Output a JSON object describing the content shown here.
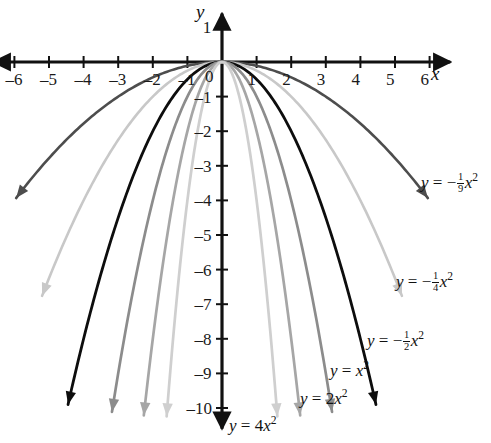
{
  "figure": {
    "axis_x_name": "x",
    "axis_y_name": "y"
  },
  "chart_data": {
    "type": "line",
    "title": "",
    "xlabel": "x",
    "ylabel": "y",
    "xlim": [
      -6.6,
      6.6
    ],
    "ylim": [
      -10.6,
      1.4
    ],
    "grid": false,
    "legend": "inline-labels",
    "x_ticks": [
      -6,
      -5,
      -4,
      -3,
      -2,
      -1,
      1,
      2,
      3,
      4,
      5,
      6
    ],
    "x_tick_labels": [
      "-6",
      "-5",
      "-4",
      "-3",
      "-2",
      "-1",
      "1",
      "2",
      "3",
      "4",
      "5",
      "6"
    ],
    "y_ticks": [
      1,
      -1,
      -2,
      -3,
      -4,
      -5,
      -6,
      -7,
      -8,
      -9,
      -10
    ],
    "y_tick_labels": [
      "1",
      "-1",
      "-2",
      "-3",
      "-4",
      "-5",
      "-6",
      "-7",
      "-8",
      "-9",
      "-10"
    ],
    "origin_label": "0",
    "series": [
      {
        "name": "y = -1/9 x^2",
        "coefficient": -0.1111,
        "color": "#4d4d4d",
        "width": 2.6,
        "x_domain": [
          -5.95,
          5.95
        ],
        "label_html": "<i>y</i> = &minus;<span class=\"frac\"><span class=\"num\">1</span><span class=\"den\">9</span></span><i>x</i><span class=\"sup\">2</span>",
        "label_pos": [
          421,
          172
        ]
      },
      {
        "name": "y = -1/4 x^2",
        "coefficient": -0.25,
        "color": "#c8c8c8",
        "width": 2.6,
        "x_domain": [
          -5.2,
          5.2
        ],
        "label_html": "<i>y</i> = &minus;<span class=\"frac\"><span class=\"num\">1</span><span class=\"den\">4</span></span><i>x</i><span class=\"sup\">2</span>",
        "label_pos": [
          396,
          271
        ]
      },
      {
        "name": "y = -1/2 x^2",
        "coefficient": -0.5,
        "color": "#0d0d0d",
        "width": 2.8,
        "x_domain": [
          -4.45,
          4.45
        ],
        "label_html": "<i>y</i> = &minus;<span class=\"frac\"><span class=\"num\">1</span><span class=\"den\">2</span></span><i>x</i><span class=\"sup\">2</span>",
        "label_pos": [
          367,
          330
        ]
      },
      {
        "name": "y = x^2",
        "coefficient": -1,
        "color": "#8c8c8c",
        "width": 2.7,
        "x_domain": [
          -3.18,
          3.18
        ],
        "label_html": "<i>y</i> = <i>x</i><span class=\"sup\">2</span>",
        "label_pos": [
          330,
          360
        ]
      },
      {
        "name": "y = 2x^2",
        "coefficient": -2,
        "color": "#a6a6a6",
        "width": 2.7,
        "x_domain": [
          -2.26,
          2.26
        ],
        "label_html": "<i>y</i> = 2<i>x</i><span class=\"sup\">2</span>",
        "label_pos": [
          300,
          388
        ]
      },
      {
        "name": "y = 4x^2",
        "coefficient": -4,
        "color": "#cfcfcf",
        "width": 2.7,
        "x_domain": [
          -1.6,
          1.6
        ],
        "label_html": "<i>y</i> = 4<i>x</i><span class=\"sup\">2</span>",
        "label_pos": [
          229,
          415
        ]
      }
    ]
  },
  "geometry": {
    "origin_x": 222,
    "origin_y": 62,
    "unit_px": 34.6
  }
}
